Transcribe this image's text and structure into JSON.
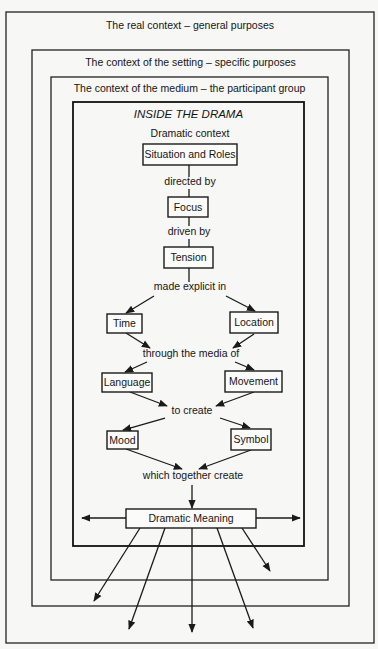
{
  "diagram": {
    "frames": [
      {
        "id": "real-context",
        "label": "The real context – general purposes",
        "x": 6,
        "y": 12,
        "w": 368,
        "h": 631,
        "label_y": 29
      },
      {
        "id": "setting-context",
        "label": "The context of the setting – specific purposes",
        "x": 32,
        "y": 50,
        "w": 317,
        "h": 556,
        "label_y": 66
      },
      {
        "id": "medium-context",
        "label": "The context of the medium – the participant group",
        "x": 51,
        "y": 77,
        "w": 277,
        "h": 503,
        "label_y": 92
      },
      {
        "id": "inside-drama",
        "label": "INSIDE THE DRAMA",
        "x": 73,
        "y": 102,
        "w": 231,
        "h": 444,
        "label_y": 118
      }
    ],
    "subtitle": {
      "label": "Dramatic context",
      "x": 190,
      "y": 137
    },
    "nodes": [
      {
        "id": "situation-and-roles",
        "label": "Situation and Roles",
        "x": 143,
        "y": 144,
        "w": 94,
        "h": 21
      },
      {
        "id": "focus",
        "label": "Focus",
        "x": 168,
        "y": 197,
        "w": 40,
        "h": 20
      },
      {
        "id": "tension",
        "label": "Tension",
        "x": 164,
        "y": 247,
        "w": 49,
        "h": 21
      },
      {
        "id": "time",
        "label": "Time",
        "x": 107,
        "y": 314,
        "w": 35,
        "h": 19
      },
      {
        "id": "location",
        "label": "Location",
        "x": 230,
        "y": 312,
        "w": 48,
        "h": 21
      },
      {
        "id": "language",
        "label": "Language",
        "x": 102,
        "y": 373,
        "w": 50,
        "h": 19
      },
      {
        "id": "movement",
        "label": "Movement",
        "x": 225,
        "y": 371,
        "w": 57,
        "h": 21
      },
      {
        "id": "mood",
        "label": "Mood",
        "x": 107,
        "y": 431,
        "w": 31,
        "h": 18
      },
      {
        "id": "symbol",
        "label": "Symbol",
        "x": 231,
        "y": 429,
        "w": 40,
        "h": 21
      },
      {
        "id": "dramatic-meaning",
        "label": "Dramatic Meaning",
        "x": 126,
        "y": 509,
        "w": 130,
        "h": 19
      }
    ],
    "connectors": [
      {
        "id": "directed-by",
        "label": "directed by",
        "x": 190,
        "y": 185
      },
      {
        "id": "driven-by",
        "label": "driven by",
        "x": 189,
        "y": 235
      },
      {
        "id": "made-explicit-in",
        "label": "made explicit in",
        "x": 190,
        "y": 290
      },
      {
        "id": "through-the-media-of",
        "label": "through the media of",
        "x": 191,
        "y": 357
      },
      {
        "id": "to-create",
        "label": "to create",
        "x": 192,
        "y": 414
      },
      {
        "id": "which-together-create",
        "label": "which together create",
        "x": 193,
        "y": 479
      }
    ],
    "edges": [
      {
        "from": [
          189,
          165
        ],
        "to": [
          189,
          177
        ],
        "arrow": false
      },
      {
        "from": [
          189,
          189
        ],
        "to": [
          189,
          197
        ],
        "arrow": false
      },
      {
        "from": [
          189,
          217
        ],
        "to": [
          189,
          226
        ],
        "arrow": false
      },
      {
        "from": [
          189,
          239
        ],
        "to": [
          189,
          247
        ],
        "arrow": false
      },
      {
        "from": [
          189,
          268
        ],
        "to": [
          189,
          282
        ],
        "arrow": false
      },
      {
        "from": [
          154,
          296
        ],
        "to": [
          126,
          313
        ],
        "arrow": true
      },
      {
        "from": [
          226,
          296
        ],
        "to": [
          255,
          311
        ],
        "arrow": true
      },
      {
        "from": [
          126,
          333
        ],
        "to": [
          150,
          348
        ],
        "arrow": true
      },
      {
        "from": [
          254,
          334
        ],
        "to": [
          233,
          348
        ],
        "arrow": true
      },
      {
        "from": [
          147,
          362
        ],
        "to": [
          125,
          372
        ],
        "arrow": true
      },
      {
        "from": [
          235,
          362
        ],
        "to": [
          254,
          370
        ],
        "arrow": true
      },
      {
        "from": [
          130,
          392
        ],
        "to": [
          167,
          406
        ],
        "arrow": true
      },
      {
        "from": [
          254,
          392
        ],
        "to": [
          216,
          406
        ],
        "arrow": true
      },
      {
        "from": [
          165,
          418
        ],
        "to": [
          123,
          430
        ],
        "arrow": true
      },
      {
        "from": [
          220,
          418
        ],
        "to": [
          250,
          428
        ],
        "arrow": true
      },
      {
        "from": [
          126,
          449
        ],
        "to": [
          182,
          469
        ],
        "arrow": true
      },
      {
        "from": [
          251,
          450
        ],
        "to": [
          199,
          469
        ],
        "arrow": true
      },
      {
        "from": [
          192,
          485
        ],
        "to": [
          192,
          508
        ],
        "arrow": true
      },
      {
        "from": [
          126,
          518
        ],
        "to": [
          82,
          518
        ],
        "arrow": true
      },
      {
        "from": [
          256,
          518
        ],
        "to": [
          300,
          518
        ],
        "arrow": true
      },
      {
        "from": [
          140,
          528
        ],
        "to": [
          94,
          601
        ],
        "arrow": true
      },
      {
        "from": [
          165,
          528
        ],
        "to": [
          129,
          629
        ],
        "arrow": true
      },
      {
        "from": [
          192,
          528
        ],
        "to": [
          192,
          632
        ],
        "arrow": true
      },
      {
        "from": [
          217,
          528
        ],
        "to": [
          253,
          628
        ],
        "arrow": true
      },
      {
        "from": [
          242,
          528
        ],
        "to": [
          270,
          571
        ],
        "arrow": true
      }
    ]
  }
}
